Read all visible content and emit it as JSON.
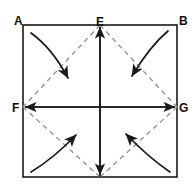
{
  "figure": {
    "background_color": "#ffffff",
    "width": 193,
    "height": 190
  },
  "labels": [
    {
      "id": "label-a",
      "text": "A",
      "x": 14,
      "y": 25,
      "corner": "top-left"
    },
    {
      "id": "label-b",
      "text": "B",
      "x": 179,
      "y": 25,
      "corner": "top-right"
    },
    {
      "id": "label-e",
      "text": "E",
      "x": 96,
      "y": 26,
      "corner": "top-middle"
    },
    {
      "id": "label-f",
      "text": "F",
      "x": 12,
      "y": 112,
      "corner": "left-middle"
    },
    {
      "id": "label-g",
      "text": "G",
      "x": 179,
      "y": 112,
      "corner": "right-middle"
    }
  ],
  "geometry": {
    "square": {
      "left": 23,
      "top": 25,
      "right": 177,
      "bottom": 177
    },
    "center": {
      "x": 100,
      "y": 107
    },
    "points": {
      "A": {
        "x": 23,
        "y": 25
      },
      "B": {
        "x": 177,
        "y": 25
      },
      "E": {
        "x": 100,
        "y": 25
      },
      "F": {
        "x": 23,
        "y": 107
      },
      "G": {
        "x": 177,
        "y": 107
      },
      "D": {
        "x": 100,
        "y": 177
      }
    },
    "solid_lines": [
      {
        "name": "vertical-axis-ED",
        "from": "E",
        "to": "D",
        "arrowheads": "both"
      },
      {
        "name": "horizontal-axis-FG",
        "from": "F",
        "to": "G",
        "arrowheads": "both"
      }
    ],
    "dashed_diagonals": [
      {
        "name": "diagonal-E-F",
        "from": "E",
        "to": "F"
      },
      {
        "name": "diagonal-E-G",
        "from": "E",
        "to": "G"
      },
      {
        "name": "diagonal-F-D",
        "from": "F",
        "to": "D"
      },
      {
        "name": "diagonal-G-D",
        "from": "G",
        "to": "D"
      }
    ],
    "curved_arrows": [
      {
        "name": "arrow-top-left",
        "quadrant": "top-left",
        "direction": "down-right",
        "path": "M 31 33 Q 52 48 70 80"
      },
      {
        "name": "arrow-top-right",
        "quadrant": "top-right",
        "direction": "down-left",
        "path": "M 168 31 Q 150 46 130 78"
      },
      {
        "name": "arrow-bottom-left",
        "quadrant": "bottom-left",
        "direction": "up-right",
        "path": "M 31 172 Q 52 156 78 133"
      },
      {
        "name": "arrow-bottom-right",
        "quadrant": "bottom-right",
        "direction": "up-left",
        "path": "M 170 172 Q 148 156 124 132"
      }
    ]
  },
  "colors": {
    "stroke_solid": "#1a1a1a",
    "stroke_dashed": "#8e8e8e",
    "label_text": "#111111",
    "background": "#ffffff"
  }
}
